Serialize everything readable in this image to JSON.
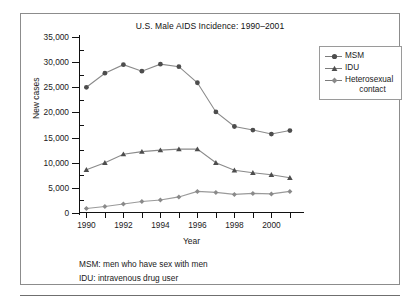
{
  "figure": {
    "title": "U.S. Male AIDS Incidence: 1990–2001",
    "footnotes": [
      "MSM: men who have sex with men",
      "IDU: intravenous drug user"
    ]
  },
  "legend": {
    "position": "top-right",
    "entries": [
      {
        "label": "MSM",
        "marker": "circle-marker",
        "color": "#4d4d4d"
      },
      {
        "label": "IDU",
        "marker": "triangle-marker",
        "color": "#4d4d4d"
      },
      {
        "label": "Heterosexual",
        "label2": "contact",
        "marker": "diamond-marker",
        "color": "#8a8a8a"
      }
    ]
  },
  "axes": {
    "y_label": "New cases",
    "x_label": "Year",
    "y_ticks": [
      "0",
      "5,000",
      "10,000",
      "15,000",
      "20,000",
      "25,000",
      "30,000",
      "35,000"
    ],
    "x_ticks": [
      "1990",
      "1992",
      "1994",
      "1996",
      "1998",
      "2000"
    ]
  },
  "chart_data": {
    "type": "line",
    "title": "U.S. Male AIDS Incidence: 1990–2001",
    "xlabel": "Year",
    "ylabel": "New cases",
    "x": [
      1990,
      1991,
      1992,
      1993,
      1994,
      1995,
      1996,
      1997,
      1998,
      1999,
      2000,
      2001
    ],
    "xlim": [
      1989.6,
      2001.6
    ],
    "ylim": [
      0,
      35000
    ],
    "yticks": [
      0,
      5000,
      10000,
      15000,
      20000,
      25000,
      30000,
      35000
    ],
    "xticks": [
      1990,
      1992,
      1994,
      1996,
      1998,
      2000
    ],
    "grid": false,
    "legend_position": "top-right",
    "series": [
      {
        "name": "MSM",
        "marker": "circle",
        "color": "#4d4d4d",
        "values": [
          25000,
          27800,
          29500,
          28200,
          29600,
          29100,
          25900,
          20100,
          17200,
          16500,
          15700,
          16400
        ]
      },
      {
        "name": "IDU",
        "marker": "triangle",
        "color": "#4d4d4d",
        "values": [
          8600,
          10000,
          11700,
          12200,
          12500,
          12700,
          12700,
          10000,
          8500,
          8000,
          7600,
          7000
        ]
      },
      {
        "name": "Heterosexual contact",
        "marker": "diamond",
        "color": "#8a8a8a",
        "values": [
          900,
          1300,
          1800,
          2300,
          2600,
          3200,
          4300,
          4100,
          3700,
          3900,
          3800,
          4300
        ]
      }
    ]
  }
}
